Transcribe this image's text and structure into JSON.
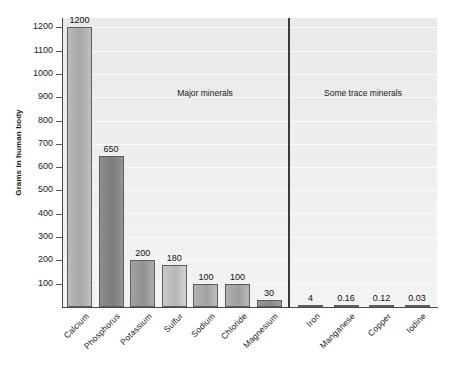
{
  "chart_data": {
    "type": "bar",
    "title": "",
    "xlabel": "",
    "ylabel": "Grams in human body",
    "ylim": [
      0,
      1240
    ],
    "ytick_step": 100,
    "yticks": [
      100,
      200,
      300,
      400,
      500,
      600,
      700,
      800,
      900,
      1000,
      1100,
      1200
    ],
    "grid": true,
    "legend": "none",
    "categories": [
      "Calcium",
      "Phosphorus",
      "Potassium",
      "Sulfur",
      "Sodium",
      "Chloride",
      "Magnesium",
      "Iron",
      "Manganese",
      "Copper",
      "Iodine"
    ],
    "values": [
      1200,
      650,
      200,
      180,
      100,
      100,
      30,
      4,
      0.16,
      0.12,
      0.03
    ],
    "value_labels": [
      "1200",
      "650",
      "200",
      "180",
      "100",
      "100",
      "30",
      "4",
      "0.16",
      "0.12",
      "0.03"
    ],
    "bar_colors": [
      "#b9b9b9",
      "#8d8d8d",
      "#a3a3a3",
      "#c9c9c9",
      "#b3b3b3",
      "#b0b0b0",
      "#9a9a9a",
      "#8f8f8f",
      "#9a9a9a",
      "#9a9a9a",
      "#9a9a9a"
    ],
    "annotations": [
      {
        "text": "Major minerals",
        "group": "major"
      },
      {
        "text": "Some trace minerals",
        "group": "trace"
      }
    ],
    "groups": {
      "major": [
        "Calcium",
        "Phosphorus",
        "Potassium",
        "Sulfur",
        "Sodium",
        "Chloride",
        "Magnesium"
      ],
      "trace": [
        "Iron",
        "Manganese",
        "Copper",
        "Iodine"
      ]
    }
  },
  "colors": {
    "plot_background": "#eeeeee",
    "gridline": "#fcfcfc",
    "axis": "#4a4a4a",
    "divider": "#3a3a3a",
    "text": "#1b1b1b"
  }
}
